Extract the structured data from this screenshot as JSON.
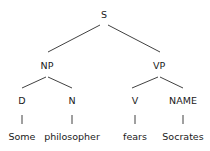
{
  "tree": {
    "nodes": {
      "s": {
        "label": "S",
        "x": 104,
        "y": 15
      },
      "np": {
        "label": "NP",
        "x": 47,
        "y": 66
      },
      "vp": {
        "label": "VP",
        "x": 159,
        "y": 66
      },
      "d": {
        "label": "D",
        "x": 22,
        "y": 101
      },
      "n": {
        "label": "N",
        "x": 72,
        "y": 101
      },
      "v": {
        "label": "V",
        "x": 135,
        "y": 101
      },
      "name": {
        "label": "NAME",
        "x": 183,
        "y": 101
      },
      "w_some": {
        "label": "Some",
        "x": 22,
        "y": 137
      },
      "w_phil": {
        "label": "philosopher",
        "x": 72,
        "y": 137
      },
      "w_fears": {
        "label": "fears",
        "x": 135,
        "y": 137
      },
      "w_socr": {
        "label": "Socrates",
        "x": 183,
        "y": 137
      }
    },
    "edges": [
      {
        "from": "S",
        "to": "NP",
        "x1": 100,
        "y1": 25,
        "x2": 48,
        "y2": 52
      },
      {
        "from": "S",
        "to": "VP",
        "x1": 108,
        "y1": 25,
        "x2": 160,
        "y2": 52
      },
      {
        "from": "NP",
        "to": "D",
        "x1": 46,
        "y1": 77,
        "x2": 22,
        "y2": 88
      },
      {
        "from": "NP",
        "to": "N",
        "x1": 48,
        "y1": 77,
        "x2": 72,
        "y2": 88
      },
      {
        "from": "VP",
        "to": "V",
        "x1": 158,
        "y1": 77,
        "x2": 132,
        "y2": 88
      },
      {
        "from": "VP",
        "to": "NAME",
        "x1": 160,
        "y1": 77,
        "x2": 183,
        "y2": 88
      },
      {
        "from": "D",
        "to": "Some",
        "x1": 22,
        "y1": 115,
        "x2": 22,
        "y2": 124
      },
      {
        "from": "N",
        "to": "philosopher",
        "x1": 72,
        "y1": 115,
        "x2": 72,
        "y2": 124
      },
      {
        "from": "V",
        "to": "fears",
        "x1": 135,
        "y1": 115,
        "x2": 135,
        "y2": 124
      },
      {
        "from": "NAME",
        "to": "Socrates",
        "x1": 183,
        "y1": 115,
        "x2": 183,
        "y2": 124
      }
    ]
  }
}
